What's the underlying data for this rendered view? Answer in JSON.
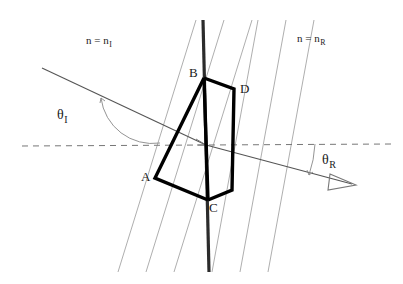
{
  "figure": {
    "background_color": "#ffffff",
    "width": 403,
    "height": 284,
    "colors": {
      "ray": "#555555",
      "wavefront": "#999999",
      "interface": "#2b2b2b",
      "parallelogram": "#000000",
      "normal_dashed": "#777777",
      "text": "#1a1a1a"
    }
  },
  "labels": {
    "medium_incident": {
      "base": "n = n",
      "sub": "I"
    },
    "medium_refracted": {
      "base": "n = n",
      "sub": "R"
    },
    "angle_incident": {
      "base": "θ",
      "sub": "I"
    },
    "angle_refracted": {
      "base": "θ",
      "sub": "R"
    },
    "vertex_a": "A",
    "vertex_b": "B",
    "vertex_c": "C",
    "vertex_d": "D"
  },
  "geometry": {
    "interface": {
      "x1": 203,
      "y1": 20,
      "x2": 209,
      "y2": 272
    },
    "normal": {
      "x1": 22,
      "y1": 146,
      "x2": 392,
      "y2": 144
    },
    "incident_ray": {
      "x1": 42,
      "y1": 68,
      "x2": 206,
      "y2": 145
    },
    "refracted_ray": {
      "x1": 206,
      "y1": 145,
      "x2": 352,
      "y2": 184
    },
    "vertices": {
      "A": {
        "x": 155,
        "y": 178
      },
      "B": {
        "x": 204,
        "y": 78
      },
      "C": {
        "x": 208,
        "y": 200
      },
      "D": {
        "x": 234,
        "y": 89
      }
    },
    "wavefronts_incident": [
      {
        "x1": 196,
        "y1": 20,
        "x2": 118,
        "y2": 272
      },
      {
        "x1": 224,
        "y1": 20,
        "x2": 146,
        "y2": 272
      },
      {
        "x1": 252,
        "y1": 20,
        "x2": 174,
        "y2": 272
      }
    ],
    "wavefronts_refracted": [
      {
        "x1": 258,
        "y1": 20,
        "x2": 212,
        "y2": 272
      },
      {
        "x1": 286,
        "y1": 20,
        "x2": 240,
        "y2": 272
      },
      {
        "x1": 314,
        "y1": 20,
        "x2": 268,
        "y2": 272
      }
    ],
    "arc_incident": {
      "cx": 206,
      "cy": 145,
      "radius": 88
    },
    "arc_refracted": {
      "cx": 206,
      "cy": 145,
      "radius": 110
    }
  }
}
